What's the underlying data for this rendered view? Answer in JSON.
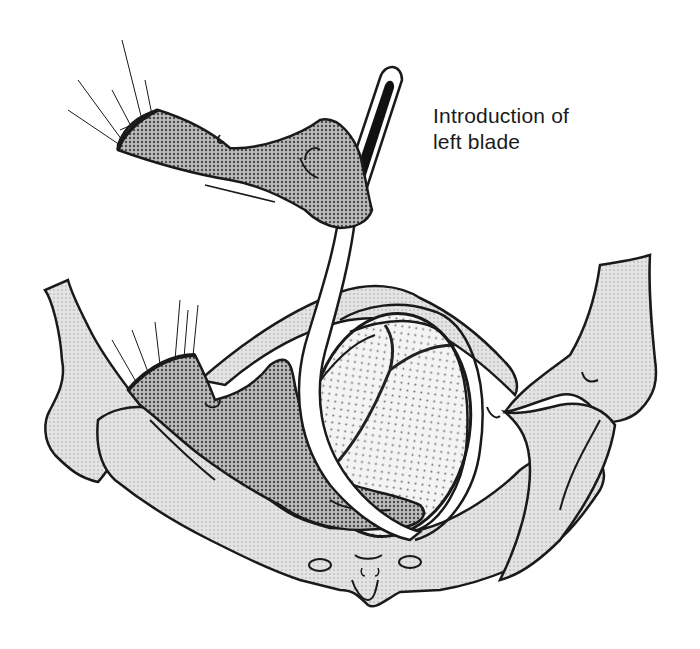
{
  "figure": {
    "label_lines": [
      "Introduction of",
      "left blade"
    ],
    "parts": {
      "upper_hand": "gloved-right-hand-holding-handle",
      "lower_hand": "gloved-left-hand-guiding-blade",
      "instrument": "forceps-left-blade",
      "pelvis": "maternal-pelvis",
      "fetal_head": "fetal-head-with-sutures"
    },
    "colors": {
      "line": "#1a1a1a",
      "bone_fill": "#dcdcdc",
      "glove_fill": "#9a9a9a",
      "head_fill": "#ebebeb",
      "blade_fill": "#ffffff",
      "handle_slot": "#111111",
      "background": "#ffffff"
    }
  }
}
